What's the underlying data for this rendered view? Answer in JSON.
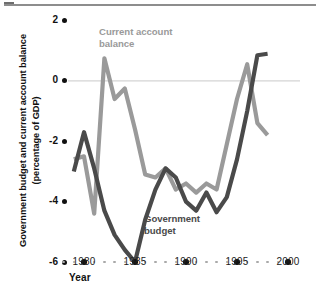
{
  "figure": {
    "kind": "line-chart",
    "background": "#ffffff"
  },
  "axes": {
    "y_axis_title": "Government budget and current account balance (percentage of GDP)",
    "y_axis_title_line1": "Government budget and current account balance",
    "y_axis_title_line2": "(percentage of GDP)",
    "x_axis_title": "Year",
    "y_ticks": [
      "2",
      "0",
      "-2",
      "-4",
      "-6"
    ],
    "y_tick_values": [
      2,
      0,
      -2,
      -4,
      -6
    ],
    "x_ticks": [
      "1980",
      "1985",
      "1990",
      "1995",
      "2000"
    ],
    "x_tick_values": [
      1980,
      1985,
      1990,
      1995,
      2000
    ]
  },
  "annotations": {
    "current_account_label": "Current account balance",
    "current_account_label_line1": "Current account",
    "current_account_label_line2": "balance",
    "government_budget_label": "Government budget",
    "government_budget_label_line1": "Government",
    "government_budget_label_line2": "budget"
  },
  "colors": {
    "current_account": "#9a9a9a",
    "government_budget": "#4a4a4a",
    "zero_line": "#d4d4d4",
    "tick": "#111111",
    "minor_tick": "#a9a9a9",
    "top_rule": "#8d8d8d"
  },
  "chart_data": {
    "type": "line",
    "title": "",
    "subtitle": "",
    "xlabel": "Year",
    "ylabel": "Government budget and current account balance (percentage of GDP)",
    "xlim": [
      1978,
      2000
    ],
    "ylim": [
      -6,
      2
    ],
    "yticks": [
      2,
      0,
      -2,
      -4,
      -6
    ],
    "xticks": [
      1980,
      1985,
      1990,
      1995,
      2000
    ],
    "grid": false,
    "legend": "inline-annotations",
    "zero_reference_line": 0,
    "x": [
      1979,
      1980,
      1981,
      1982,
      1983,
      1984,
      1985,
      1986,
      1987,
      1988,
      1989,
      1990,
      1991,
      1992,
      1993,
      1994,
      1995,
      1996,
      1997,
      1998
    ],
    "series": [
      {
        "name": "Current account balance",
        "color": "#9a9a9a",
        "values": [
          -2.6,
          -2.5,
          -4.4,
          0.75,
          -0.6,
          -0.25,
          -1.6,
          -3.1,
          -3.2,
          -2.9,
          -3.6,
          -3.4,
          -3.7,
          -3.4,
          -3.6,
          -2.1,
          -0.6,
          0.55,
          -1.4,
          -1.8
        ]
      },
      {
        "name": "Government budget",
        "color": "#4a4a4a",
        "values": [
          -3.0,
          -1.7,
          -2.9,
          -4.3,
          -5.1,
          -5.6,
          -6.0,
          -4.6,
          -3.6,
          -2.9,
          -3.2,
          -4.0,
          -4.3,
          -3.7,
          -4.35,
          -3.85,
          -2.6,
          -1.0,
          0.85,
          0.9
        ]
      }
    ]
  }
}
